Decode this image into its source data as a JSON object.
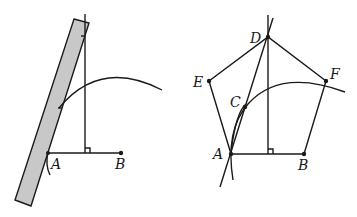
{
  "figures": {
    "left": {
      "description": "Construction step: ruler placed along A, vertical perpendicular through midpoint of AB, arc drawn",
      "labels": {
        "A": "A",
        "B": "B"
      },
      "ruler_color": "#c8c8c8"
    },
    "right": {
      "description": "Regular pentagon ABFDE constructed with auxiliary point C",
      "labels": {
        "A": "A",
        "B": "B",
        "C": "C",
        "D": "D",
        "E": "E",
        "F": "F"
      }
    }
  }
}
